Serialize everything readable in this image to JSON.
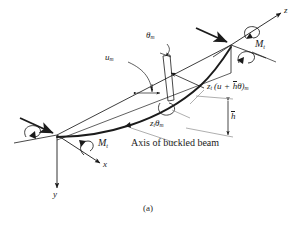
{
  "figure": {
    "caption": "(a)",
    "axis_note": "Axis of buckled beam",
    "ink_color": "#1b1b1b",
    "leader_color": "#9a9a9a",
    "background": "#ffffff"
  },
  "axes": [
    {
      "name": "z",
      "label": "z"
    },
    {
      "name": "x",
      "label": "x"
    },
    {
      "name": "y",
      "label": "y"
    }
  ],
  "moments": {
    "right_label_m": "M",
    "right_label_sub": "t",
    "left_label_m": "M",
    "left_label_sub": "t"
  },
  "annotations": {
    "theta_m_sym": "θ",
    "theta_m_sub": "m",
    "u_m_sym": "u",
    "u_m_sub": "m",
    "disp_prefix_z": "z",
    "disp_prefix_sub": "t",
    "disp_open": "(u",
    "disp_plus": "+",
    "disp_hbar": "h",
    "disp_theta": "θ)",
    "disp_tail_sub": "m",
    "ztheta_z": "z",
    "ztheta_zsub": "t",
    "ztheta_theta": "θ",
    "ztheta_sub": "m",
    "hbar_label": "h"
  }
}
